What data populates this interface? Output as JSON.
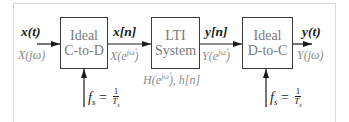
{
  "diagram": {
    "blocks": [
      {
        "id": "c-to-d",
        "line1": "Ideal",
        "line2": "C-to-D"
      },
      {
        "id": "lti",
        "line1": "LTI",
        "line2": "System"
      },
      {
        "id": "d-to-c",
        "line1": "Ideal",
        "line2": "D-to-C"
      }
    ],
    "signals": {
      "input": {
        "time": "x(t)",
        "freq": "X(jω)"
      },
      "sampled": {
        "time": "x[n]",
        "freq_base": "X(e",
        "freq_exp": "jω̂",
        "freq_close": ")"
      },
      "output_discrete": {
        "time": "y[n]",
        "freq_base": "Y(e",
        "freq_exp": "jω̂",
        "freq_close": ")"
      },
      "output": {
        "time": "y(t)",
        "freq": "Y(jω)"
      }
    },
    "system_label": {
      "base": "H(e",
      "exp": "jω̂",
      "rest": "), h[n]"
    },
    "sampling": {
      "lhs_f": "f",
      "lhs_sub": "s",
      "eq": " = ",
      "num": "1",
      "den_T": "T",
      "den_sub": "s"
    },
    "colors": {
      "line": "#1a1a1a",
      "box_border": "#3a3a3a",
      "box_text": "#7a7a7a",
      "freq_label": "#8a8a8a",
      "frame": "#d8d8d8"
    }
  }
}
